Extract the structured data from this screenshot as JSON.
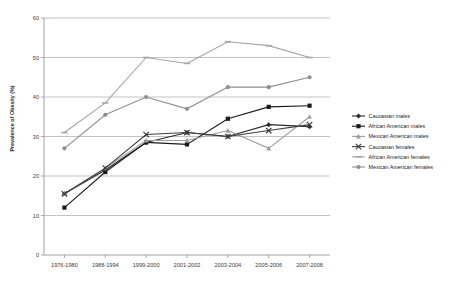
{
  "chart_data": {
    "type": "line",
    "title": "",
    "xlabel": "",
    "ylabel": "Prevalence of Obesity (%)",
    "ylim": [
      0,
      60
    ],
    "ytick_step": 10,
    "yticks": [
      "0",
      "10",
      "20",
      "30",
      "40",
      "50",
      "60"
    ],
    "grid": true,
    "legend_position": "right",
    "categories": [
      "1976-1980",
      "1988-1994",
      "1999-2000",
      "2001-2002",
      "2003-2004",
      "2005-2006",
      "2007-2008"
    ],
    "series": [
      {
        "name": "Caucasian males",
        "color": "#2b2b2b",
        "marker": "diamond",
        "values": [
          15.5,
          21.5,
          28.5,
          31.0,
          30.0,
          33.0,
          32.5
        ]
      },
      {
        "name": "African American males",
        "color": "#1a1a1a",
        "marker": "square",
        "values": [
          12.0,
          21.0,
          28.5,
          28.0,
          34.5,
          37.5,
          37.8
        ]
      },
      {
        "name": "Mexican American males",
        "color": "#9c9c9c",
        "marker": "triangle",
        "values": [
          15.5,
          22.0,
          29.0,
          29.0,
          31.5,
          27.0,
          35.0
        ]
      },
      {
        "name": "Caucasian females",
        "color": "#3d3d3d",
        "marker": "cross",
        "values": [
          15.5,
          22.0,
          30.5,
          31.0,
          30.0,
          31.5,
          33.0
        ]
      },
      {
        "name": "African American females",
        "color": "#a5a5a5",
        "marker": "dash",
        "values": [
          31.0,
          38.5,
          50.0,
          48.5,
          54.0,
          53.0,
          50.0
        ]
      },
      {
        "name": "Mexican American females",
        "color": "#8e8e8e",
        "marker": "circle",
        "values": [
          27.0,
          35.5,
          40.0,
          37.0,
          42.5,
          42.5,
          45.0
        ]
      }
    ]
  },
  "legend": {
    "items": [
      {
        "label": "Caucasian males"
      },
      {
        "label": "African American males"
      },
      {
        "label": "Mexican American males"
      },
      {
        "label": "Caucasian females"
      },
      {
        "label": "African American females"
      },
      {
        "label": "Mexican American females"
      }
    ]
  },
  "caption": {
    "text": ""
  }
}
